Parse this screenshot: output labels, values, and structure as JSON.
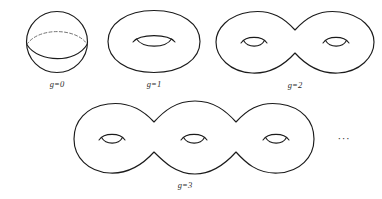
{
  "figure": {
    "background_color": "#ffffff",
    "stroke_color": "#1b1b1b",
    "dashed_stroke_color": "#6b6b6b",
    "label_color": "#2a2a2a",
    "continuation_marker": "···"
  },
  "surfaces": [
    {
      "id": "genus-0",
      "label": "g=0",
      "genus": 0,
      "holes": 0,
      "shape": "sphere",
      "description": "circle with solid front equator arc and dashed back equator arc",
      "center_x": 57,
      "center_y": 42,
      "radius": 31
    },
    {
      "id": "genus-1",
      "label": "g=1",
      "genus": 1,
      "holes": 1,
      "shape": "torus",
      "description": "ellipse with one central lens-shaped hole",
      "center_x": 154,
      "center_y": 42
    },
    {
      "id": "genus-2",
      "label": "g=2",
      "genus": 2,
      "holes": 2,
      "shape": "double-torus",
      "description": "peanut outline with two lens-shaped holes",
      "center_x": 295,
      "center_y": 42
    },
    {
      "id": "genus-3",
      "label": "g=3",
      "genus": 3,
      "holes": 3,
      "shape": "triple-torus",
      "description": "three-lobed outline with three lens-shaped holes",
      "center_x": 185,
      "center_y": 140
    }
  ],
  "labels": {
    "g0": "g=0",
    "g1": "g=1",
    "g2": "g=2",
    "g3": "g=3",
    "ellipsis": "···"
  }
}
